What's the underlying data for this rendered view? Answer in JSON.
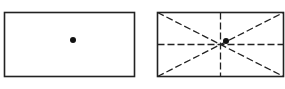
{
  "diagram": {
    "colors": {
      "stroke": "#222222",
      "background": "#ffffff"
    },
    "panels": [
      {
        "id": "left",
        "rect": {
          "x": 4.5,
          "y": 12.5,
          "w": 130,
          "h": 64
        },
        "dot": {
          "cx": 73,
          "cy": 40,
          "r": 3
        }
      },
      {
        "id": "right",
        "rect": {
          "x": 157.5,
          "y": 12.5,
          "w": 126,
          "h": 64
        },
        "dot": {
          "cx": 226,
          "cy": 41,
          "r": 3
        }
      }
    ]
  }
}
